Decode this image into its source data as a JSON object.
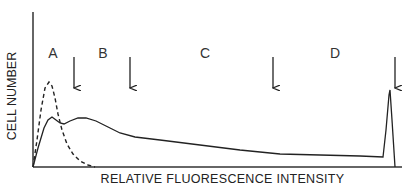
{
  "chart_data": {
    "type": "line",
    "title": "",
    "xlabel": "RELATIVE FLUORESCENCE INTENSITY",
    "ylabel": "CELL NUMBER",
    "grid": false,
    "legend": null,
    "axis_ticks": false,
    "region_labels": [
      {
        "label": "A",
        "x": 53,
        "y": 53
      },
      {
        "label": "B",
        "x": 103,
        "y": 53
      },
      {
        "label": "C",
        "x": 205,
        "y": 53
      },
      {
        "label": "D",
        "x": 335,
        "y": 53
      }
    ],
    "gate_arrows_x": [
      74,
      130,
      273,
      395
    ],
    "series": [
      {
        "name": "control (dashed)",
        "style": "dashed",
        "points": [
          [
            33,
            167
          ],
          [
            37,
            140
          ],
          [
            41,
            110
          ],
          [
            45,
            88
          ],
          [
            49,
            82
          ],
          [
            52,
            86
          ],
          [
            55,
            98
          ],
          [
            58,
            114
          ],
          [
            62,
            130
          ],
          [
            67,
            144
          ],
          [
            73,
            154
          ],
          [
            80,
            161
          ],
          [
            88,
            165
          ],
          [
            95,
            167
          ]
        ]
      },
      {
        "name": "sample (solid)",
        "style": "solid",
        "points": [
          [
            33,
            167
          ],
          [
            38,
            148
          ],
          [
            44,
            128
          ],
          [
            48,
            120
          ],
          [
            52,
            117
          ],
          [
            56,
            120
          ],
          [
            60,
            123
          ],
          [
            64,
            124
          ],
          [
            70,
            121
          ],
          [
            78,
            118
          ],
          [
            86,
            118
          ],
          [
            96,
            121
          ],
          [
            108,
            127
          ],
          [
            120,
            133
          ],
          [
            135,
            137
          ],
          [
            160,
            140
          ],
          [
            200,
            145
          ],
          [
            240,
            150
          ],
          [
            280,
            154
          ],
          [
            320,
            155
          ],
          [
            360,
            156
          ],
          [
            383,
            157
          ],
          [
            386,
            130
          ],
          [
            389,
            95
          ],
          [
            390,
            90
          ],
          [
            392,
            120
          ],
          [
            395,
            167
          ]
        ]
      }
    ]
  }
}
